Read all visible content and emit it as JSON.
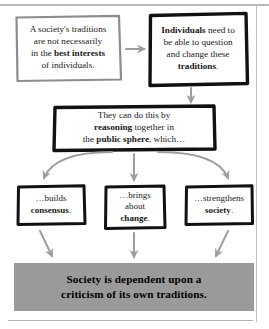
{
  "diagram": {
    "type": "flowchart",
    "nodes": [
      {
        "id": "traditions",
        "name": "node-traditions",
        "border_style": "hand-drawn",
        "border_color": "#8c8c8c",
        "text_plain": "A society's traditions are not necessarily in the best interests of individuals.",
        "lines": [
          [
            {
              "t": "A society's traditions",
              "b": false
            }
          ],
          [
            {
              "t": "are not necessarily",
              "b": false
            }
          ],
          [
            {
              "t": "in the ",
              "b": false
            },
            {
              "t": "best interests",
              "b": true
            }
          ],
          [
            {
              "t": "of individuals.",
              "b": false
            }
          ]
        ]
      },
      {
        "id": "individuals",
        "name": "node-individuals",
        "border_style": "hand-drawn",
        "border_color": "#111111",
        "text_plain": "Individuals need to be able to question and change these traditions.",
        "lines": [
          [
            {
              "t": "Individuals",
              "b": true
            },
            {
              "t": " need to",
              "b": false
            }
          ],
          [
            {
              "t": "be able to question",
              "b": false
            }
          ],
          [
            {
              "t": "and change these",
              "b": false
            }
          ],
          [
            {
              "t": "traditions",
              "b": true
            },
            {
              "t": ".",
              "b": false
            }
          ]
        ]
      },
      {
        "id": "reasoning",
        "name": "node-reasoning",
        "border_style": "hand-drawn",
        "border_color": "#111111",
        "text_plain": "They can do this by reasoning together in the public sphere, which…",
        "lines": [
          [
            {
              "t": "They can do this by",
              "b": false
            }
          ],
          [
            {
              "t": "reasoning",
              "b": true
            },
            {
              "t": " together in",
              "b": false
            }
          ],
          [
            {
              "t": "the ",
              "b": false
            },
            {
              "t": "public sphere",
              "b": true
            },
            {
              "t": ", which…",
              "b": false
            }
          ]
        ]
      },
      {
        "id": "consensus",
        "name": "node-consensus",
        "border_style": "hand-drawn",
        "border_color": "#111111",
        "text_plain": "…builds consensus.",
        "lines": [
          [
            {
              "t": "…builds",
              "b": false
            }
          ],
          [
            {
              "t": "consensus",
              "b": true
            },
            {
              "t": ".",
              "b": false
            }
          ]
        ]
      },
      {
        "id": "change",
        "name": "node-change",
        "border_style": "hand-drawn",
        "border_color": "#111111",
        "text_plain": "…brings about change.",
        "lines": [
          [
            {
              "t": "…brings",
              "b": false
            }
          ],
          [
            {
              "t": "about",
              "b": false
            }
          ],
          [
            {
              "t": "change",
              "b": true
            },
            {
              "t": ".",
              "b": false
            }
          ]
        ]
      },
      {
        "id": "society",
        "name": "node-society",
        "border_style": "hand-drawn",
        "border_color": "#111111",
        "text_plain": "…strengthens society.",
        "lines": [
          [
            {
              "t": "…strengthens",
              "b": false
            }
          ],
          [
            {
              "t": "society",
              "b": true
            },
            {
              "t": ".",
              "b": false
            }
          ]
        ]
      }
    ],
    "banner": {
      "text_plain": "Society is dependent upon a criticism of its own traditions.",
      "lines": [
        "Society is dependent upon a",
        "criticism of its own traditions."
      ],
      "fill_color": "#9a9a9a",
      "text_color": "#000000"
    },
    "connectors": [
      {
        "id": "traditions-to-individuals",
        "from": "traditions",
        "to": "individuals",
        "shape": "straight",
        "direction": "right",
        "color": "#9e9e9e"
      },
      {
        "id": "individuals-to-reasoning",
        "from": "individuals",
        "to": "reasoning",
        "shape": "straight",
        "direction": "down",
        "color": "#9e9e9e"
      },
      {
        "id": "reasoning-to-consensus",
        "from": "reasoning",
        "to": "consensus",
        "shape": "curved",
        "direction": "down-left",
        "color": "#9e9e9e"
      },
      {
        "id": "reasoning-to-change",
        "from": "reasoning",
        "to": "change",
        "shape": "straight",
        "direction": "down",
        "color": "#9e9e9e"
      },
      {
        "id": "reasoning-to-society",
        "from": "reasoning",
        "to": "society",
        "shape": "curved",
        "direction": "down-right",
        "color": "#9e9e9e"
      },
      {
        "id": "consensus-to-banner",
        "from": "consensus",
        "to": "banner",
        "shape": "straight",
        "direction": "down-right",
        "color": "#9e9e9e"
      },
      {
        "id": "change-to-banner",
        "from": "change",
        "to": "banner",
        "shape": "straight",
        "direction": "down",
        "color": "#9e9e9e"
      },
      {
        "id": "society-to-banner",
        "from": "society",
        "to": "banner",
        "shape": "straight",
        "direction": "down-left",
        "color": "#9e9e9e"
      }
    ]
  }
}
